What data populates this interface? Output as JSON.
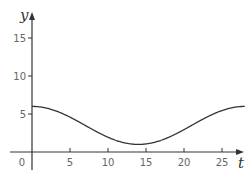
{
  "chart_data": {
    "type": "line",
    "title": "",
    "xlabel": "t",
    "ylabel": "y",
    "xlim": [
      0,
      28
    ],
    "ylim": [
      0,
      18
    ],
    "x_ticks": [
      5,
      10,
      15,
      20,
      25
    ],
    "y_ticks": [
      5,
      10,
      15
    ],
    "origin_label": "0",
    "grid": false,
    "legend": null,
    "series": [
      {
        "name": "y(t)",
        "function": "y = 3.5 + 2.5*cos(2*pi*t/28)",
        "x": [
          0,
          2,
          4,
          6,
          8,
          10,
          12,
          14,
          16,
          18,
          20,
          22,
          24,
          26,
          28
        ],
        "values": [
          6.0,
          5.75,
          5.06,
          4.06,
          2.94,
          1.94,
          1.25,
          1.0,
          1.25,
          1.94,
          2.94,
          4.06,
          5.06,
          5.75,
          6.0
        ]
      }
    ]
  },
  "colors": {
    "axis": "#333333",
    "curve": "#333333",
    "tick_label": "#666666"
  }
}
